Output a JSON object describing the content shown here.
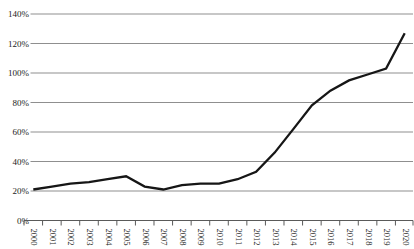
{
  "chart_data": {
    "type": "line",
    "title": "",
    "xlabel": "",
    "ylabel": "",
    "x_labels": [
      "2000",
      "2001",
      "2002",
      "2003",
      "2004",
      "2005",
      "2006",
      "2007",
      "2008",
      "2009",
      "2010",
      "2011",
      "2012",
      "2013",
      "2014",
      "2015",
      "2016",
      "2017",
      "2018",
      "2019",
      "2020"
    ],
    "series": [
      {
        "name": "percent-of-total",
        "values": [
          21,
          23,
          25,
          26,
          28,
          30,
          23,
          21,
          24,
          25,
          25,
          28,
          33,
          46,
          62,
          78,
          88,
          95,
          99,
          103,
          127
        ]
      }
    ],
    "y_ticks": [
      "0%",
      "20%",
      "40%",
      "60%",
      "80%",
      "100%",
      "120%",
      "140%"
    ],
    "y_tick_values": [
      0,
      20,
      40,
      60,
      80,
      100,
      120,
      140
    ],
    "ylim": [
      0,
      140
    ],
    "grid": "horizontal",
    "legend_position": "none",
    "colors": {
      "line": "#161616",
      "grid": "#8f8f8f",
      "axis": "#5a5a5a",
      "label": "#1c1c1c",
      "background": "#ffffff"
    }
  }
}
